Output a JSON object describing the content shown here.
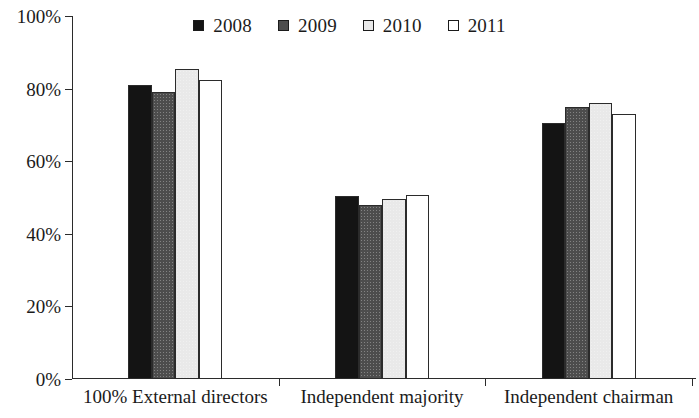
{
  "chart_data": {
    "type": "bar",
    "title": "",
    "xlabel": "",
    "ylabel": "",
    "ylim": [
      0,
      100
    ],
    "yticks": [
      "0%",
      "20%",
      "40%",
      "60%",
      "80%",
      "100%"
    ],
    "ytick_values": [
      0,
      20,
      40,
      60,
      80,
      100
    ],
    "grid": false,
    "legend_position": "top-center",
    "categories": [
      "100% External directors",
      "Independent majority",
      "Independent chairman"
    ],
    "series": [
      {
        "name": "2008",
        "color": "#141414",
        "values": [
          81.0,
          50.5,
          70.5
        ]
      },
      {
        "name": "2009",
        "color": "#4d4d4d",
        "values": [
          79.0,
          48.0,
          75.0
        ]
      },
      {
        "name": "2010",
        "color": "#e9e9e9",
        "values": [
          85.5,
          49.5,
          76.0
        ]
      },
      {
        "name": "2011",
        "color": "#ffffff",
        "values": [
          82.5,
          50.7,
          73.0
        ]
      }
    ]
  },
  "legend": {
    "items": [
      {
        "label": "2008",
        "swatch": "legend-swatch-2008"
      },
      {
        "label": "2009",
        "swatch": "legend-swatch-2009"
      },
      {
        "label": "2010",
        "swatch": "legend-swatch-2010"
      },
      {
        "label": "2011",
        "swatch": "legend-swatch-2011"
      }
    ]
  },
  "axes": {
    "y_axis_name": "y-axis",
    "x_axis_name": "x-axis"
  }
}
